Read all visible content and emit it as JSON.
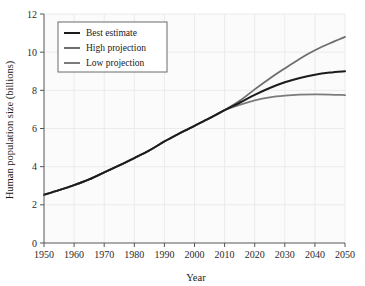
{
  "chart_data": {
    "type": "line",
    "title": "",
    "xlabel": "Year",
    "ylabel": "Human population size (billions)",
    "xlim": [
      1950,
      2050
    ],
    "ylim": [
      0,
      12
    ],
    "grid": true,
    "legend_position": "top-left",
    "xticks": [
      1950,
      1960,
      1970,
      1980,
      1990,
      2000,
      2010,
      2020,
      2030,
      2040,
      2050
    ],
    "yticks": [
      0,
      2,
      4,
      6,
      8,
      10,
      12
    ],
    "xtick_labels": [
      "1950",
      "1960",
      "1970",
      "1980",
      "1990",
      "2000",
      "2010",
      "2020",
      "2030",
      "2040",
      "2050"
    ],
    "ytick_labels": [
      "0",
      "2",
      "4",
      "6",
      "8",
      "10",
      "12"
    ],
    "x": [
      1950,
      1955,
      1960,
      1965,
      1970,
      1975,
      1980,
      1985,
      1990,
      1995,
      2000,
      2005,
      2010,
      2015,
      2020,
      2025,
      2030,
      2035,
      2040,
      2045,
      2050
    ],
    "series": [
      {
        "name": "Best estimate",
        "color": "#1c1c1c",
        "width": 2.0,
        "values": [
          2.53,
          2.77,
          3.03,
          3.33,
          3.7,
          4.07,
          4.45,
          4.85,
          5.32,
          5.74,
          6.14,
          6.54,
          6.96,
          7.35,
          7.76,
          8.12,
          8.42,
          8.65,
          8.82,
          8.93,
          9.0
        ]
      },
      {
        "name": "High projection",
        "color": "#6e6e6e",
        "width": 1.8,
        "values": [
          2.53,
          2.77,
          3.03,
          3.33,
          3.7,
          4.07,
          4.45,
          4.85,
          5.32,
          5.74,
          6.14,
          6.54,
          6.96,
          7.45,
          8.05,
          8.62,
          9.15,
          9.66,
          10.1,
          10.47,
          10.8
        ]
      },
      {
        "name": "Low projection",
        "color": "#7b7b7b",
        "width": 1.8,
        "values": [
          2.53,
          2.77,
          3.03,
          3.33,
          3.7,
          4.07,
          4.45,
          4.85,
          5.32,
          5.74,
          6.14,
          6.54,
          6.96,
          7.24,
          7.47,
          7.63,
          7.72,
          7.77,
          7.79,
          7.78,
          7.75
        ]
      }
    ],
    "annotations": []
  },
  "legend": {
    "entries": [
      {
        "label": "Best estimate"
      },
      {
        "label": "High projection"
      },
      {
        "label": "Low projection"
      }
    ]
  }
}
